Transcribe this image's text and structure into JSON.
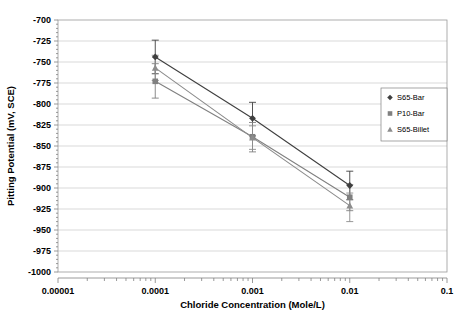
{
  "chart_data": {
    "type": "line",
    "title": "",
    "xlabel": "Chloride Concentration (Mole/L)",
    "ylabel": "Pitting Potential (mV, SCE)",
    "xscale": "log",
    "xlim": [
      1e-05,
      0.1
    ],
    "ylim": [
      -1000,
      -700
    ],
    "grid": true,
    "legend_position": "right",
    "xticks": [
      1e-05,
      0.0001,
      0.001,
      0.01,
      0.1
    ],
    "xtick_labels": [
      "0.00001",
      "0.0001",
      "0.001",
      "0.01",
      "0.1"
    ],
    "yticks": [
      -700,
      -725,
      -750,
      -775,
      -800,
      -825,
      -850,
      -875,
      -900,
      -925,
      -950,
      -975,
      -1000
    ],
    "ytick_labels": [
      "-700",
      "-725",
      "-750",
      "-775",
      "-800",
      "-825",
      "-850",
      "-875",
      "-900",
      "-925",
      "-950",
      "-975",
      "-1000"
    ],
    "x": [
      0.0001,
      0.001,
      0.01
    ],
    "series": [
      {
        "name": "S65-Bar",
        "marker": "diamond",
        "color": "#3f3f3f",
        "values": [
          -744,
          -817,
          -897
        ],
        "err_upper": [
          -724,
          -798,
          -880
        ],
        "err_lower": [
          -764,
          -838,
          -914
        ]
      },
      {
        "name": "P10-Bar",
        "marker": "square",
        "color": "#808080",
        "values": [
          -773,
          -839,
          -911
        ],
        "err_upper": [
          -752,
          -822,
          -896
        ],
        "err_lower": [
          -793,
          -857,
          -927
        ]
      },
      {
        "name": "S65-Billet",
        "marker": "triangle",
        "color": "#8c8c8c",
        "values": [
          -757,
          -840,
          -921
        ],
        "err_upper": [
          -742,
          -826,
          -906
        ],
        "err_lower": [
          -772,
          -854,
          -940
        ]
      }
    ]
  },
  "legend": {
    "entries": [
      {
        "label": "S65-Bar",
        "marker": "diamond"
      },
      {
        "label": "P10-Bar",
        "marker": "square"
      },
      {
        "label": "S65-Billet",
        "marker": "triangle"
      }
    ]
  }
}
